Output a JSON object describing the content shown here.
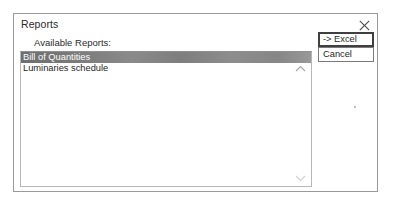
{
  "dialog": {
    "title": "Reports",
    "close_icon": "close-icon",
    "label": "Available Reports:",
    "listbox": {
      "items": [
        {
          "label": "Bill of Quantities",
          "selected": true
        },
        {
          "label": "Luminaries schedule",
          "selected": false
        }
      ],
      "scroll_up_icon": "chevron-up-icon",
      "scroll_down_icon": "chevron-down-icon"
    },
    "buttons": [
      {
        "label": "-> Excel",
        "name": "export-to-excel-button",
        "default": true
      },
      {
        "label": "Cancel",
        "name": "cancel-button",
        "default": false
      }
    ],
    "colors": {
      "selection": "#7b7b7b",
      "border": "#9a9a9a",
      "text": "#1f1f1f"
    }
  }
}
